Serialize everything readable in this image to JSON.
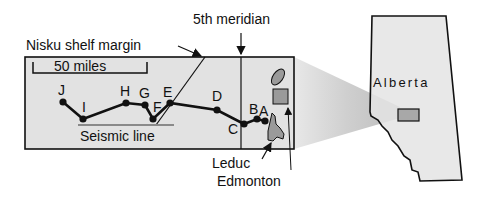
{
  "labels": {
    "meridian": "5th meridian",
    "shelf_margin": "Nisku shelf margin",
    "scale": "50 miles",
    "seismic_line": "Seismic line",
    "leduc": "Leduc",
    "edmonton": "Edmonton",
    "province": "Alberta"
  },
  "points": [
    {
      "id": "J",
      "label": "J"
    },
    {
      "id": "I",
      "label": "I"
    },
    {
      "id": "H",
      "label": "H"
    },
    {
      "id": "G",
      "label": "G"
    },
    {
      "id": "F",
      "label": "F"
    },
    {
      "id": "E",
      "label": "E"
    },
    {
      "id": "D",
      "label": "D"
    },
    {
      "id": "C",
      "label": "C"
    },
    {
      "id": "B",
      "label": "B"
    },
    {
      "id": "A",
      "label": "A"
    }
  ],
  "colors": {
    "box_fill": "#e2e2e2",
    "feature_fill": "#9a9a9a",
    "seismic_bar": "#8a8a8a",
    "line": "#111111"
  }
}
